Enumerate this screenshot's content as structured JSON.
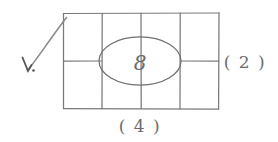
{
  "figure": {
    "kind": "hand-drawn-sketch",
    "ink_color": "#7a7a7a",
    "ink_color_dark": "#5c5c5c",
    "background_color": "#ffffff"
  },
  "grid": {
    "name": "rectangle-grid",
    "columns": 4,
    "rows": 2,
    "left": 63,
    "top": 13,
    "right": 219,
    "bottom": 109,
    "column_divider_x": [
      102,
      141,
      180
    ],
    "row_divider_y": [
      61
    ]
  },
  "ellipse": {
    "name": "centre-ellipse",
    "center_x": 140,
    "center_y": 61,
    "radius_x": 41,
    "radius_y": 24,
    "value": "8"
  },
  "labels": {
    "bottom": {
      "text": "( 4 )",
      "x": 140,
      "y": 128,
      "meaning": "width-label"
    },
    "right": {
      "text": "( 2 )",
      "x": 245,
      "y": 62,
      "meaning": "height-label"
    }
  },
  "annotation": {
    "arrow": {
      "name": "pointer-arrow",
      "tail_x": 27,
      "tail_y": 71,
      "head_x": 66,
      "head_y": 17,
      "points_to": "grid-top-left-corner"
    },
    "tick_mark": {
      "text": "",
      "x": 28,
      "y": 70
    }
  }
}
